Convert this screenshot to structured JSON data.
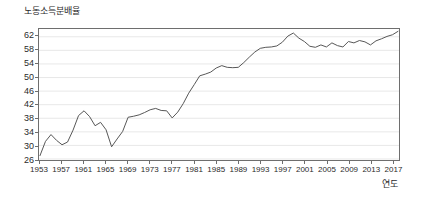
{
  "chart_data": {
    "type": "line",
    "title": "노동소득분배율",
    "xlabel": "연도",
    "ylabel": "노동소득분배율",
    "ylim": [
      26,
      64
    ],
    "xlim": [
      1953,
      2018
    ],
    "grid": true,
    "legend": null,
    "ytick_labels": [
      "62",
      "58",
      "54",
      "50",
      "46",
      "42",
      "38",
      "34",
      "30",
      "26"
    ],
    "ytick_values": [
      62,
      58,
      54,
      50,
      46,
      42,
      38,
      34,
      30,
      26
    ],
    "xtick_labels": [
      "1953",
      "1957",
      "1961",
      "1965",
      "1969",
      "1973",
      "1977",
      "1981",
      "1985",
      "1989",
      "1993",
      "1997",
      "2001",
      "2005",
      "2009",
      "2013",
      "2017"
    ],
    "xtick_values": [
      1953,
      1957,
      1961,
      1965,
      1969,
      1973,
      1977,
      1981,
      1985,
      1989,
      1993,
      1997,
      2001,
      2005,
      2009,
      2013,
      2017
    ],
    "line_color": "#555555",
    "x": [
      1953,
      1954,
      1955,
      1956,
      1957,
      1958,
      1959,
      1960,
      1961,
      1962,
      1963,
      1964,
      1965,
      1966,
      1967,
      1968,
      1969,
      1970,
      1971,
      1972,
      1973,
      1974,
      1975,
      1976,
      1977,
      1978,
      1979,
      1980,
      1981,
      1982,
      1983,
      1984,
      1985,
      1986,
      1987,
      1988,
      1989,
      1990,
      1991,
      1992,
      1993,
      1994,
      1995,
      1996,
      1997,
      1998,
      1999,
      2000,
      2001,
      2002,
      2003,
      2004,
      2005,
      2006,
      2007,
      2008,
      2009,
      2010,
      2011,
      2012,
      2013,
      2014,
      2015,
      2016,
      2017,
      2018
    ],
    "values": [
      27.0,
      31.2,
      33.2,
      31.5,
      30.2,
      31.0,
      34.5,
      38.8,
      40.2,
      38.5,
      35.8,
      36.8,
      34.6,
      29.6,
      31.9,
      34.1,
      38.3,
      38.6,
      39.0,
      39.7,
      40.5,
      40.9,
      40.3,
      40.2,
      38.1,
      39.8,
      42.3,
      45.4,
      47.9,
      50.5,
      51.0,
      51.6,
      52.8,
      53.5,
      53.0,
      52.9,
      53.0,
      54.4,
      56.0,
      57.5,
      58.6,
      58.9,
      59.0,
      59.3,
      60.4,
      62.2,
      63.1,
      61.6,
      60.6,
      59.2,
      58.9,
      59.6,
      59.0,
      60.2,
      59.4,
      59.0,
      60.6,
      60.2,
      60.9,
      60.5,
      59.6,
      60.8,
      61.4,
      62.1,
      62.6,
      63.6
    ],
    "series": [
      {
        "name": "노동소득분배율",
        "values": [
          27.0,
          31.2,
          33.2,
          31.5,
          30.2,
          31.0,
          34.5,
          38.8,
          40.2,
          38.5,
          35.8,
          36.8,
          34.6,
          29.6,
          31.9,
          34.1,
          38.3,
          38.6,
          39.0,
          39.7,
          40.5,
          40.9,
          40.3,
          40.2,
          38.1,
          39.8,
          42.3,
          45.4,
          47.9,
          50.5,
          51.0,
          51.6,
          52.8,
          53.5,
          53.0,
          52.9,
          53.0,
          54.4,
          56.0,
          57.5,
          58.6,
          58.9,
          59.0,
          59.3,
          60.4,
          62.2,
          63.1,
          61.6,
          60.6,
          59.2,
          58.9,
          59.6,
          59.0,
          60.2,
          59.4,
          59.0,
          60.6,
          60.2,
          60.9,
          60.5,
          59.6,
          60.8,
          61.4,
          62.1,
          62.6,
          63.6
        ]
      }
    ]
  }
}
